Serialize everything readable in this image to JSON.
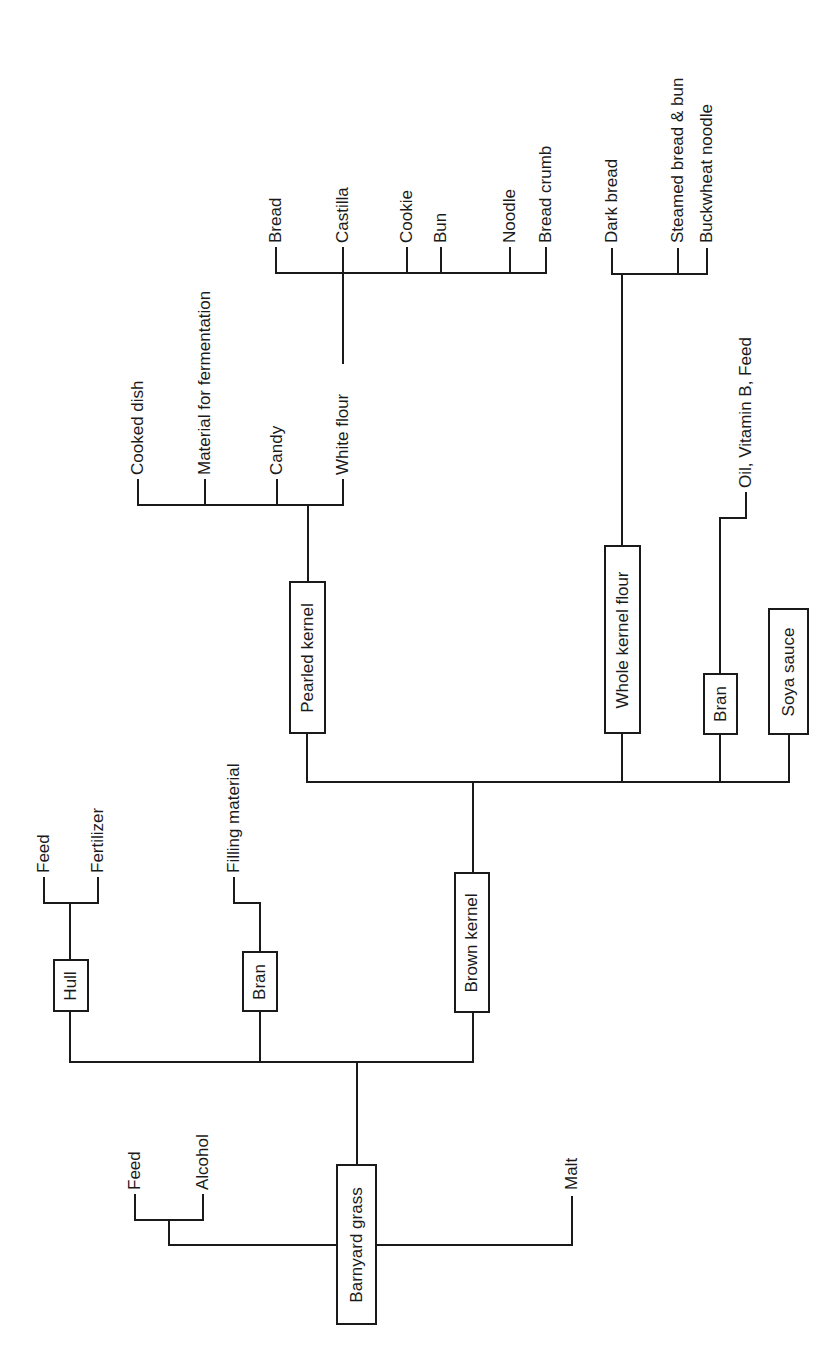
{
  "diagram": {
    "type": "flowchart-tree",
    "orientation": "rotated-90-ccw",
    "line_color": "#1a1a1a",
    "root": "Barnyard grass",
    "boxes": [
      {
        "id": "barnyard-grass",
        "label": "Barnyard grass",
        "x": 336,
        "y": 1164,
        "w": 41,
        "h": 161
      },
      {
        "id": "hull",
        "label": "Hull",
        "x": 53,
        "y": 959,
        "w": 36,
        "h": 53
      },
      {
        "id": "bran-1",
        "label": "Bran",
        "x": 242,
        "y": 951,
        "w": 36,
        "h": 61
      },
      {
        "id": "brown-kernel",
        "label": "Brown kernel",
        "x": 454,
        "y": 872,
        "w": 36,
        "h": 141
      },
      {
        "id": "pearled-kernel",
        "label": "Pearled kernel",
        "x": 289,
        "y": 581,
        "w": 37,
        "h": 153
      },
      {
        "id": "whole-kernel-flour",
        "label": "Whole kernel flour",
        "x": 604,
        "y": 545,
        "w": 37,
        "h": 189
      },
      {
        "id": "bran-2",
        "label": "Bran",
        "x": 703,
        "y": 673,
        "w": 35,
        "h": 62
      },
      {
        "id": "soya-sauce",
        "label": "Soya sauce",
        "x": 768,
        "y": 608,
        "w": 41,
        "h": 127
      }
    ],
    "labels": [
      {
        "id": "feed-1",
        "text": "Feed",
        "x": 135,
        "bottom": 1190
      },
      {
        "id": "alcohol",
        "text": "Alcohol",
        "x": 203,
        "bottom": 1190
      },
      {
        "id": "malt",
        "text": "Malt",
        "x": 572,
        "bottom": 1190
      },
      {
        "id": "feed-2",
        "text": "Feed",
        "x": 44,
        "bottom": 873
      },
      {
        "id": "fertilizer",
        "text": "Fertilizer",
        "x": 98,
        "bottom": 873
      },
      {
        "id": "filling-material",
        "text": "Filling material",
        "x": 234,
        "bottom": 873
      },
      {
        "id": "cooked-dish",
        "text": "Cooked dish",
        "x": 138,
        "bottom": 475
      },
      {
        "id": "material-for-fermentation",
        "text": "Material for fermentation",
        "x": 205,
        "bottom": 475
      },
      {
        "id": "candy",
        "text": "Candy",
        "x": 277,
        "bottom": 475
      },
      {
        "id": "white-flour",
        "text": "White flour",
        "x": 343,
        "bottom": 475
      },
      {
        "id": "bread",
        "text": "Bread",
        "x": 276,
        "bottom": 243
      },
      {
        "id": "castilla",
        "text": "Castilla",
        "x": 343,
        "bottom": 243
      },
      {
        "id": "cookie",
        "text": "Cookie",
        "x": 407,
        "bottom": 243
      },
      {
        "id": "bun",
        "text": "Bun",
        "x": 441,
        "bottom": 243
      },
      {
        "id": "noodle",
        "text": "Noodle",
        "x": 510,
        "bottom": 243
      },
      {
        "id": "bread-crumb",
        "text": "Bread crumb",
        "x": 546,
        "bottom": 243
      },
      {
        "id": "dark-bread",
        "text": "Dark bread",
        "x": 612,
        "bottom": 243
      },
      {
        "id": "steamed-bread-bun",
        "text": "Steamed bread & bun",
        "x": 678,
        "bottom": 243
      },
      {
        "id": "buckwheat-noodle",
        "text": "Buckwheat noodle",
        "x": 707,
        "bottom": 243
      },
      {
        "id": "oil-vitamin-b-feed",
        "text": "Oil, Vitamin B, Feed",
        "x": 746,
        "bottom": 488
      }
    ],
    "edges": [
      "M357,1164 V1062",
      "M70,1062 H473",
      "M70,1062 V1012",
      "M260,1062 V1012",
      "M473,1062 V1013",
      "M336,1245 H169 V1220",
      "M135,1195 V1220 H203 V1195",
      "M377,1245 H572 V1197",
      "M70,959 V903",
      "M44,878 V903 H98 V878",
      "M260,951 V903 H234 V878",
      "M473,872 V782",
      "M307,782 H789",
      "M307,782 V734",
      "M622,782 V734",
      "M720,782 V735",
      "M789,782 V735",
      "M308,581 V505",
      "M138,480 V505 H343 V480",
      "M205,505 V480",
      "M277,505 V480",
      "M343,505 V480",
      "M343,363 V273",
      "M276,248 V273 H546 V248",
      "M343,273 V248",
      "M407,273 V248",
      "M441,273 V248",
      "M510,273 V248",
      "M622,545 V274",
      "M612,249 V274 H707 V249",
      "M678,274 V249",
      "M720,673 V518 H746 V493"
    ]
  }
}
